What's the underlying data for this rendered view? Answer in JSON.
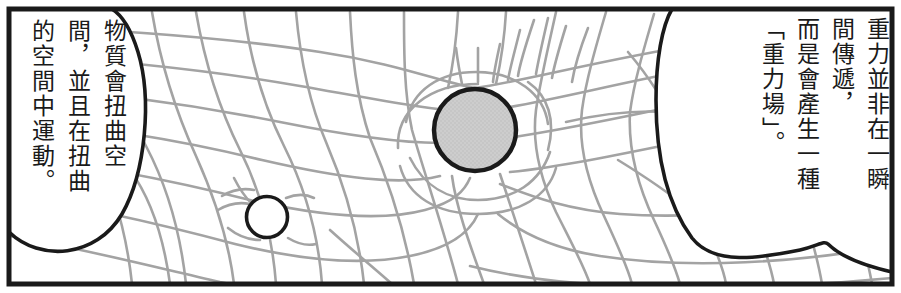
{
  "panel": {
    "name": "gravity-spacetime-manga-panel",
    "border_color": "#1a1a1a",
    "background_color": "#ffffff",
    "grid_color": "#a0a0a0",
    "sphere_fill": "#cccccc",
    "sphere_stroke": "#1a1a1a",
    "small_circle_fill": "#ffffff",
    "small_circle_stroke": "#1a1a1a"
  },
  "balloons": {
    "left": {
      "full_text": "物質會扭曲空間，並且在扭曲的空間中運動。",
      "columns": [
        "物質會扭曲空",
        "間，並且在扭曲",
        "的空間中運動。"
      ]
    },
    "right": {
      "full_text": "重力並非在一瞬間傳遞，而是會產生一種「重力場」。",
      "columns": [
        "重力並非在一瞬",
        "間傳遞，",
        "而是會產生一種",
        "「重力場」。"
      ]
    }
  },
  "objects": {
    "large_sphere": {
      "label": "large-mass-sphere",
      "cx": 475,
      "cy": 130,
      "r": 41
    },
    "small_circle": {
      "label": "small-mass-circle",
      "cx": 267,
      "cy": 217,
      "r": 21
    }
  }
}
